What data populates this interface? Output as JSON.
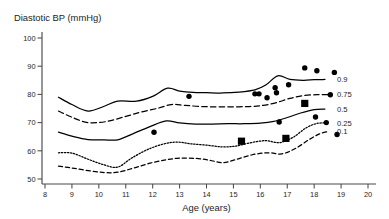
{
  "chart_data": {
    "type": "line",
    "title": "Diastotic BP (mmHg)",
    "xlabel": "Age (years)",
    "ylabel": "Diastotic BP (mmHg)",
    "xlim": [
      8,
      20
    ],
    "ylim": [
      48,
      102
    ],
    "grid": false,
    "legend_position": "right-of-plot",
    "x_ticks": [
      8,
      9,
      10,
      11,
      12,
      13,
      14,
      15,
      16,
      17,
      18,
      19,
      20
    ],
    "x_tick_labels": [
      "8",
      "9",
      "10",
      "11",
      "12",
      "13",
      "14",
      "15",
      "16",
      "17",
      "18",
      "19",
      "20"
    ],
    "y_ticks": [
      50,
      60,
      70,
      80,
      90,
      100
    ],
    "y_tick_labels": [
      "50",
      "60",
      "70",
      "80",
      "90",
      "100"
    ],
    "series": [
      {
        "name": "0.9",
        "label": "0.9",
        "style": "solid",
        "x": [
          8.5,
          9.0,
          9.6,
          10.2,
          10.7,
          11.4,
          12.0,
          12.55,
          13.0,
          13.5,
          14.0,
          14.6,
          15.2,
          15.8,
          16.2,
          16.65,
          17.1,
          17.6,
          18.0,
          18.4
        ],
        "y": [
          79.0,
          76.4,
          74.1,
          75.8,
          77.6,
          77.6,
          79.3,
          82.2,
          81.2,
          80.7,
          80.6,
          80.5,
          80.8,
          81.6,
          83.3,
          86.6,
          85.3,
          85.0,
          85.2,
          85.3
        ]
      },
      {
        "name": "0.75",
        "label": "0.75",
        "style": "dashed",
        "x": [
          8.5,
          9.0,
          9.6,
          10.3,
          11.0,
          11.6,
          12.2,
          12.7,
          13.2,
          13.8,
          14.4,
          15.0,
          15.6,
          16.1,
          16.6,
          17.1,
          17.6,
          18.1,
          18.5
        ],
        "y": [
          74.1,
          71.9,
          70.0,
          70.4,
          72.2,
          73.8,
          75.1,
          76.4,
          76.1,
          75.7,
          75.6,
          75.6,
          75.7,
          76.1,
          77.1,
          78.6,
          79.6,
          79.9,
          79.9
        ]
      },
      {
        "name": "0.5",
        "label": "0.5",
        "style": "solid",
        "x": [
          8.5,
          9.0,
          9.6,
          10.2,
          10.7,
          11.3,
          11.9,
          12.5,
          13.0,
          13.6,
          14.2,
          14.8,
          15.4,
          16.0,
          16.5,
          17.0,
          17.5,
          18.0,
          18.4
        ],
        "y": [
          66.6,
          65.2,
          64.0,
          63.9,
          63.9,
          66.2,
          68.6,
          70.6,
          69.9,
          69.5,
          69.5,
          69.6,
          69.6,
          69.8,
          70.4,
          71.8,
          73.4,
          74.6,
          74.8
        ]
      },
      {
        "name": "0.25",
        "label": "0.25",
        "style": "dotted",
        "x": [
          8.5,
          9.0,
          9.6,
          10.2,
          10.7,
          11.2,
          11.8,
          12.4,
          12.9,
          13.4,
          14.0,
          14.6,
          15.1,
          15.6,
          16.2,
          16.7,
          17.2,
          17.7,
          18.1,
          18.5
        ],
        "y": [
          59.3,
          59.2,
          57.0,
          55.0,
          54.2,
          57.3,
          60.4,
          62.4,
          63.1,
          62.5,
          62.0,
          61.4,
          61.7,
          62.8,
          63.6,
          62.9,
          64.7,
          68.1,
          69.7,
          69.9
        ]
      },
      {
        "name": "0.1",
        "label": "0.1",
        "style": "dashed-fine",
        "x": [
          8.5,
          9.0,
          9.6,
          10.2,
          10.7,
          11.3,
          11.9,
          12.5,
          13.0,
          13.6,
          14.1,
          14.6,
          15.1,
          15.7,
          16.3,
          16.8,
          17.3,
          17.8,
          18.2,
          18.5
        ],
        "y": [
          54.6,
          53.9,
          53.0,
          52.3,
          52.4,
          53.9,
          55.6,
          56.8,
          57.4,
          57.3,
          56.7,
          55.8,
          56.9,
          58.6,
          59.3,
          58.9,
          60.8,
          63.9,
          66.0,
          66.8
        ]
      }
    ],
    "observations": [
      {
        "marker": "circle",
        "x": 12.05,
        "y": 66.6
      },
      {
        "marker": "circle",
        "x": 13.35,
        "y": 79.3
      },
      {
        "marker": "square",
        "x": 15.3,
        "y": 63.4
      },
      {
        "marker": "circle",
        "x": 15.8,
        "y": 80.2
      },
      {
        "marker": "circle",
        "x": 15.95,
        "y": 80.2
      },
      {
        "marker": "circle",
        "x": 16.25,
        "y": 78.8
      },
      {
        "marker": "circle",
        "x": 16.55,
        "y": 82.4
      },
      {
        "marker": "circle",
        "x": 16.6,
        "y": 80.6
      },
      {
        "marker": "circle",
        "x": 16.7,
        "y": 70.2
      },
      {
        "marker": "square",
        "x": 16.95,
        "y": 64.4
      },
      {
        "marker": "circle",
        "x": 17.05,
        "y": 83.4
      },
      {
        "marker": "square",
        "x": 17.65,
        "y": 76.8
      },
      {
        "marker": "circle",
        "x": 17.65,
        "y": 89.4
      },
      {
        "marker": "circle",
        "x": 18.05,
        "y": 72.0
      },
      {
        "marker": "circle",
        "x": 18.1,
        "y": 88.4
      },
      {
        "marker": "circle",
        "x": 18.45,
        "y": 70.0
      },
      {
        "marker": "circle",
        "x": 18.75,
        "y": 87.8
      },
      {
        "marker": "circle",
        "x": 18.6,
        "y": 79.9
      },
      {
        "marker": "circle",
        "x": 18.85,
        "y": 65.8
      }
    ]
  }
}
